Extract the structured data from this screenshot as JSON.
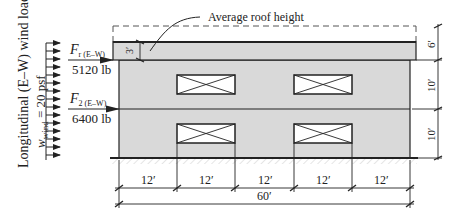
{
  "diagram": {
    "side_label": {
      "line1": "Longitudinal (E–W) wind loads",
      "line2_prefix": "w",
      "line2_sub": "wind",
      "line2_suffix": " = 20 psf"
    },
    "forces": [
      {
        "symbol": "F",
        "subscript": "r (E–W)",
        "value": "5120 lb"
      },
      {
        "symbol": "F",
        "subscript": "2 (E–W)",
        "value": "6400 lb"
      }
    ],
    "callout": {
      "label": "Average roof height",
      "dim": "3′"
    },
    "vertical_dims": [
      "6′",
      "10′",
      "10′"
    ],
    "bay_dims": [
      "12′",
      "12′",
      "12′",
      "12′",
      "12′"
    ],
    "total_dim": "60′",
    "colors": {
      "building_fill": "#d9d9d9",
      "line": "#222222",
      "window_fill": "#ffffff"
    }
  }
}
